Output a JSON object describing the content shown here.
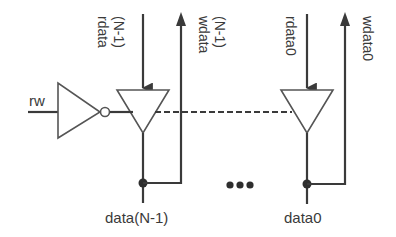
{
  "diagram": {
    "type": "tri-state bus driver array",
    "colors": {
      "line": "#3a3a3a",
      "gate_outline": "#555555",
      "background": "#ffffff"
    },
    "input": {
      "label": "rw"
    },
    "inverter": {
      "label": "inverter",
      "bubble": true
    },
    "bits": [
      {
        "read_label_line1": "rdata",
        "read_label_line2": "(N-1)",
        "write_label_line1": "wdata",
        "write_label_line2": "(N-1)",
        "bus_label": "data(N-1)"
      },
      {
        "read_label": "rdata0",
        "write_label": "wdata0",
        "bus_label": "data0"
      }
    ],
    "ellipsis": "•••"
  }
}
